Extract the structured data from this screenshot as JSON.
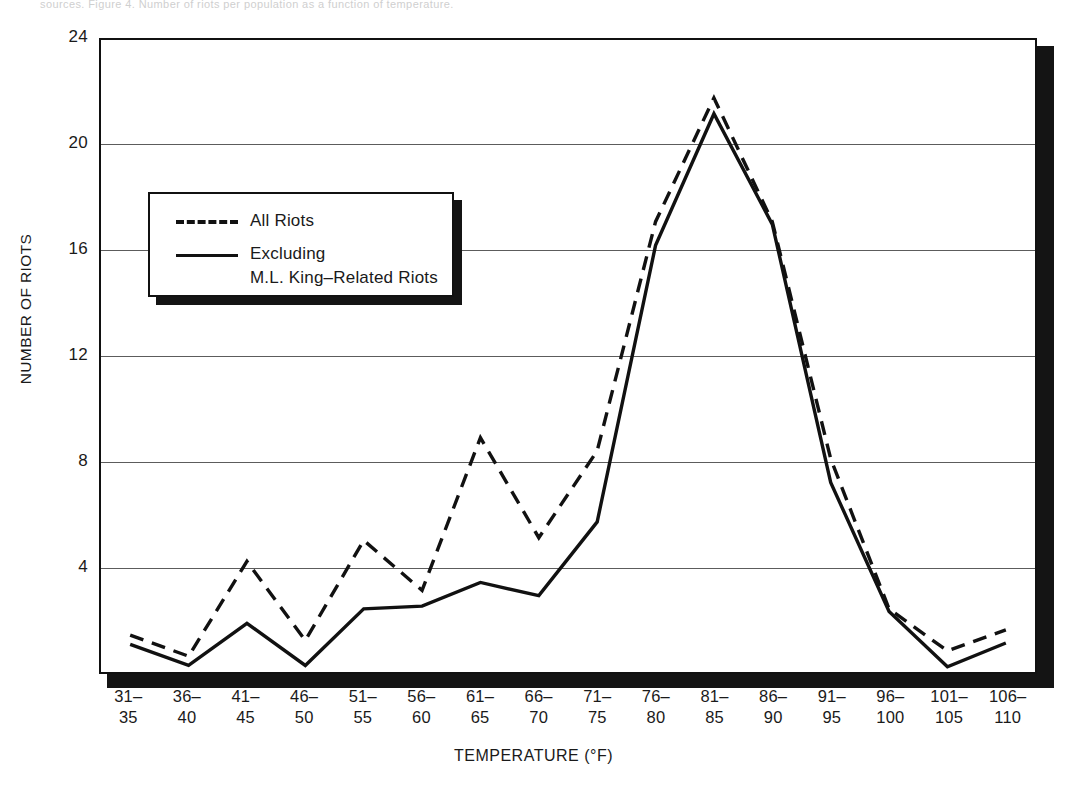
{
  "page": {
    "top_strip_text": "sources. Figure 4. Number of riots per population as a function of temperature."
  },
  "chart_data": {
    "type": "line",
    "title": "",
    "xlabel": "TEMPERATURE (°F)",
    "ylabel": "NUMBER OF RIOTS",
    "categories": [
      "31–35",
      "36–40",
      "41–45",
      "46–50",
      "51–55",
      "56–60",
      "61–65",
      "66–70",
      "71–75",
      "76–80",
      "81–85",
      "86–90",
      "91–95",
      "96–100",
      "101–105",
      "106–110"
    ],
    "category_lines": [
      [
        "31–",
        "35"
      ],
      [
        "36–",
        "40"
      ],
      [
        "41–",
        "45"
      ],
      [
        "46–",
        "50"
      ],
      [
        "51–",
        "55"
      ],
      [
        "56–",
        "60"
      ],
      [
        "61–",
        "65"
      ],
      [
        "66–",
        "70"
      ],
      [
        "71–",
        "75"
      ],
      [
        "76–",
        "80"
      ],
      [
        "81–",
        "85"
      ],
      [
        "86–",
        "90"
      ],
      [
        "91–",
        "95"
      ],
      [
        "96–",
        "100"
      ],
      [
        "101–",
        "105"
      ],
      [
        "106–",
        "110"
      ]
    ],
    "ylim": [
      0,
      24
    ],
    "yticks": [
      4,
      8,
      12,
      16,
      20,
      24
    ],
    "grid": true,
    "legend_position": "upper-left-inside",
    "series": [
      {
        "name": "All Riots",
        "style": "dashed",
        "color": "#111111",
        "values": [
          1.4,
          0.6,
          4.2,
          1.2,
          5.0,
          3.1,
          8.9,
          5.1,
          8.4,
          17.1,
          21.8,
          17.1,
          8.1,
          2.4,
          0.8,
          1.6
        ]
      },
      {
        "name": "Excluding M.L. King–Related Riots",
        "style": "solid",
        "color": "#111111",
        "values": [
          1.05,
          0.25,
          1.85,
          0.25,
          2.4,
          2.5,
          3.4,
          2.9,
          5.7,
          16.2,
          21.2,
          17.0,
          7.2,
          2.3,
          0.2,
          1.1
        ]
      }
    ],
    "legend": [
      {
        "label": "All Riots",
        "style": "dashed"
      },
      {
        "label": "Excluding",
        "label2": "M.L. King–Related Riots",
        "style": "solid"
      }
    ]
  }
}
